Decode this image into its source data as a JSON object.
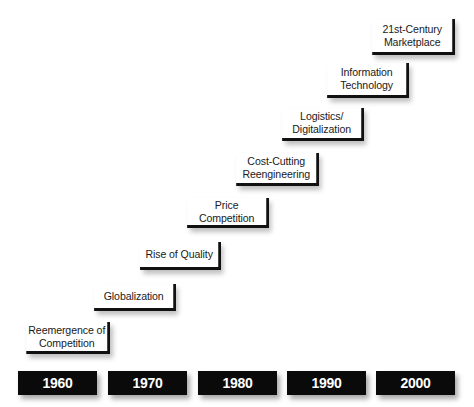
{
  "diagram": {
    "type": "staircase-timeline",
    "milestones": [
      {
        "label": "Reemergence of\nCompetition"
      },
      {
        "label": "Globalization"
      },
      {
        "label": "Rise of Quality"
      },
      {
        "label": "Price\nCompetition"
      },
      {
        "label": "Cost-Cutting\nReengineering"
      },
      {
        "label": "Logistics/\nDigitalization"
      },
      {
        "label": "Information\nTechnology"
      },
      {
        "label": "21st-Century\nMarketplace"
      }
    ],
    "years": [
      {
        "label": "1960"
      },
      {
        "label": "1970"
      },
      {
        "label": "1980"
      },
      {
        "label": "1990"
      },
      {
        "label": "2000"
      }
    ],
    "colors": {
      "year_box_bg": "#0a0a0a",
      "year_box_text": "#ffffff",
      "milestone_border": "#111111",
      "background": "#ffffff"
    }
  }
}
